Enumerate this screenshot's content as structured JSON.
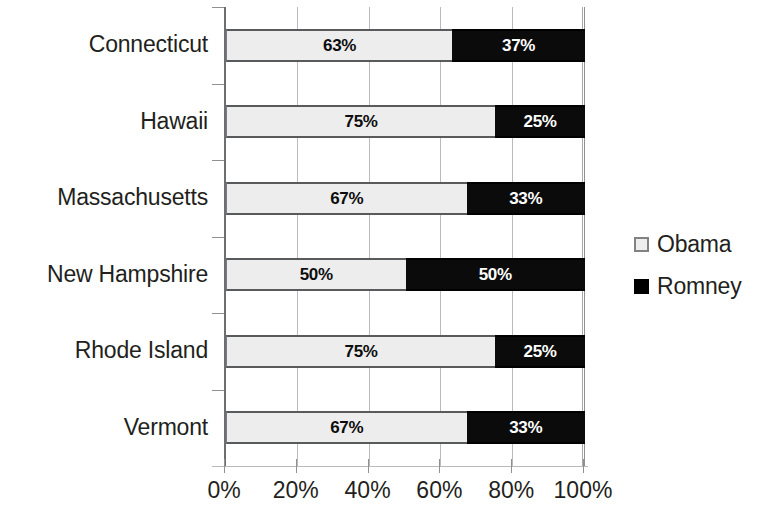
{
  "chart_data": {
    "type": "bar",
    "orientation": "horizontal",
    "stacked": true,
    "normalized": true,
    "title": "",
    "subtitle": "",
    "xlabel": "",
    "ylabel": "",
    "xlim": [
      0,
      100
    ],
    "xticks": [
      "0%",
      "20%",
      "40%",
      "60%",
      "80%",
      "100%"
    ],
    "xtick_values": [
      0,
      20,
      40,
      60,
      80,
      100
    ],
    "grid": true,
    "grid_axis": "x",
    "legend_position": "right",
    "categories": [
      "Connecticut",
      "Hawaii",
      "Massachusetts",
      "New Hampshire",
      "Rhode Island",
      "Vermont"
    ],
    "series": [
      {
        "name": "Obama",
        "color": "#ededed",
        "values": [
          63,
          75,
          67,
          50,
          75,
          67
        ],
        "labels": [
          "63%",
          "75%",
          "67%",
          "50%",
          "75%",
          "67%"
        ]
      },
      {
        "name": "Romney",
        "color": "#000000",
        "values": [
          37,
          25,
          33,
          50,
          25,
          33
        ],
        "labels": [
          "37%",
          "25%",
          "33%",
          "50%",
          "25%",
          "33%"
        ]
      }
    ]
  },
  "legend": {
    "items": [
      {
        "label": "Obama",
        "swatch": "light-gray-square"
      },
      {
        "label": "Romney",
        "swatch": "black-square"
      }
    ]
  }
}
